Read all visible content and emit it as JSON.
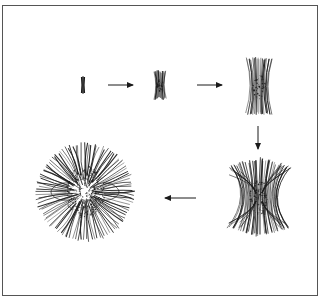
{
  "figure": {
    "title": "Stages of spherulite growth from a single fibril",
    "colors": {
      "ink": "#1a1a1a",
      "border": "#555555",
      "background": "#ffffff"
    },
    "stages": [
      {
        "id": "stage-1",
        "label": "Initial fibril",
        "cx": 83,
        "cy": 85,
        "type": "rod",
        "height": 16,
        "width": 3
      },
      {
        "id": "stage-2",
        "label": "Small sheaf",
        "cx": 160,
        "cy": 85,
        "type": "sheaf",
        "height": 30,
        "halfTop": 6,
        "halfMid": 2.5,
        "lines": 14
      },
      {
        "id": "stage-3",
        "label": "Large sheaf",
        "cx": 259,
        "cy": 86,
        "type": "sheaf",
        "height": 58,
        "halfTop": 13,
        "halfMid": 5,
        "lines": 22
      },
      {
        "id": "stage-4",
        "label": "Hourglass sheaf",
        "cx": 259,
        "cy": 197,
        "type": "hourglass",
        "height": 80,
        "halfTop": 30,
        "halfMid": 7,
        "lines": 40
      },
      {
        "id": "stage-5",
        "label": "Mature spherulite",
        "cx": 85,
        "cy": 192,
        "type": "sphere",
        "radius": 50,
        "lines": 110
      }
    ],
    "arrows": [
      {
        "id": "arrow-1",
        "x1": 108,
        "y1": 85,
        "x2": 133,
        "y2": 85,
        "direction": "right"
      },
      {
        "id": "arrow-2",
        "x1": 197,
        "y1": 85,
        "x2": 222,
        "y2": 85,
        "direction": "right"
      },
      {
        "id": "arrow-3",
        "x1": 258,
        "y1": 126,
        "x2": 258,
        "y2": 149,
        "direction": "down"
      },
      {
        "id": "arrow-4",
        "x1": 196,
        "y1": 198,
        "x2": 165,
        "y2": 198,
        "direction": "left"
      }
    ]
  }
}
